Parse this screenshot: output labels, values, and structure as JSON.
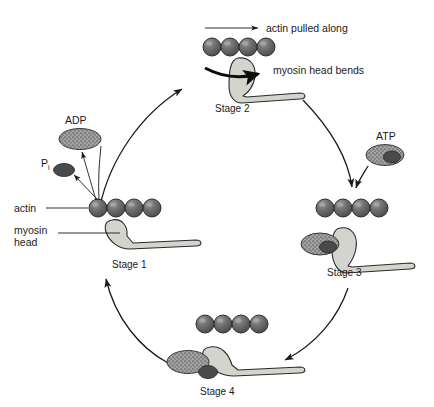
{
  "diagram": {
    "type": "cycle-diagram",
    "background_color": "#ffffff",
    "colors": {
      "actin_bead": "#6e6e6e",
      "actin_bead_dark": "#4a4a4a",
      "myosin": "#d4d4cf",
      "myosin_outline": "#2b2b2b",
      "adp_fill": "#8a8a8a",
      "pi_fill": "#4a4a4a",
      "arrow": "#1a1a1a",
      "text": "#1a1a1a"
    }
  },
  "annotations": {
    "actin_pulled_along": "actin pulled along",
    "myosin_head_bends": "myosin head bends",
    "actin_label": "actin",
    "myosin_head_label_line1": "myosin",
    "myosin_head_label_line2": "head"
  },
  "molecules": {
    "adp": "ADP",
    "atp": "ATP",
    "pi_main": "P",
    "pi_subscript": "i"
  },
  "stages": [
    {
      "id": "stage-1",
      "label": "Stage 1",
      "x": 130,
      "y": 264
    },
    {
      "id": "stage-2",
      "label": "Stage 2",
      "x": 241,
      "y": 108
    },
    {
      "id": "stage-3",
      "label": "Stage 3",
      "x": 348,
      "y": 272
    },
    {
      "id": "stage-4",
      "label": "Stage 4",
      "x": 222,
      "y": 391
    }
  ],
  "actin_filaments": [
    {
      "id": "actin-stage-1",
      "bead_count": 4,
      "x": 98,
      "y": 208
    },
    {
      "id": "actin-stage-2",
      "bead_count": 4,
      "x": 212,
      "y": 47
    },
    {
      "id": "actin-stage-3",
      "bead_count": 4,
      "x": 325,
      "y": 208
    },
    {
      "id": "actin-stage-4",
      "bead_count": 4,
      "x": 205,
      "y": 324
    }
  ]
}
